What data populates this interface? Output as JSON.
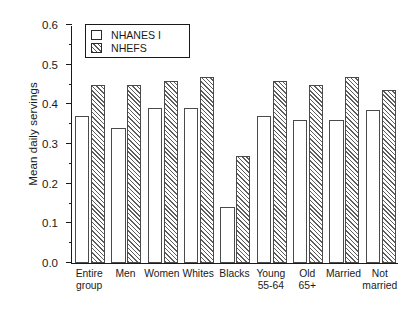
{
  "chart_data": {
    "type": "bar",
    "title": "",
    "subtitle": "",
    "xlabel": "",
    "ylabel": "Mean daily servings",
    "ylim": [
      0.0,
      0.6
    ],
    "ytick_labels": [
      "0.0",
      "0.1",
      "0.2",
      "0.3",
      "0.4",
      "0.5",
      "0.6"
    ],
    "ytick_values": [
      0.0,
      0.1,
      0.2,
      0.3,
      0.4,
      0.5,
      0.6
    ],
    "yminor_tick_values": [
      0.05,
      0.15,
      0.25,
      0.35,
      0.45,
      0.55
    ],
    "grid": false,
    "legend_position": "top-left-inside",
    "categories": [
      "Entire group",
      "Men",
      "Women",
      "Whites",
      "Blacks",
      "Young 55-64",
      "Old 65+",
      "Married",
      "Not married"
    ],
    "category_lines": [
      [
        "Entire",
        "group"
      ],
      [
        "Men",
        ""
      ],
      [
        "Women",
        ""
      ],
      [
        "Whites",
        ""
      ],
      [
        "Blacks",
        ""
      ],
      [
        "Young",
        "55-64"
      ],
      [
        "Old",
        "65+"
      ],
      [
        "Married",
        ""
      ],
      [
        "Not",
        "married"
      ]
    ],
    "series": [
      {
        "name": "NHANES I",
        "fill": "white",
        "values": [
          0.37,
          0.34,
          0.39,
          0.39,
          0.14,
          0.37,
          0.36,
          0.36,
          0.385
        ]
      },
      {
        "name": "NHEFS",
        "fill": "hatched",
        "values": [
          0.45,
          0.45,
          0.46,
          0.47,
          0.27,
          0.46,
          0.45,
          0.47,
          0.435
        ]
      }
    ]
  },
  "legend": {
    "entries": [
      {
        "label": "NHANES I",
        "swatch": "white-square-icon"
      },
      {
        "label": "NHEFS",
        "swatch": "hatched-square-icon"
      }
    ]
  },
  "colors": {
    "axis": "#1a1a1a",
    "bar_outline": "#4a4a4a",
    "hatch": "#5d5d5d",
    "background": "#ffffff"
  }
}
